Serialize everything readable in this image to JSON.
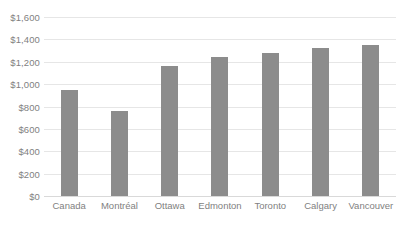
{
  "chart_data": {
    "type": "bar",
    "title": "",
    "xlabel": "",
    "ylabel": "",
    "categories": [
      "Canada",
      "Montréal",
      "Ottawa",
      "Edmonton",
      "Toronto",
      "Calgary",
      "Vancouver"
    ],
    "values": [
      947,
      760,
      1162,
      1243,
      1278,
      1323,
      1350
    ],
    "ylim": [
      0,
      1600
    ],
    "ytick_values": [
      0,
      200,
      400,
      600,
      800,
      1000,
      1200,
      1400,
      1600
    ],
    "ytick_labels": [
      "$0",
      "$200",
      "$400",
      "$600",
      "$800",
      "$1,000",
      "$1,200",
      "$1,400",
      "$1,600"
    ],
    "grid": true,
    "legend": false,
    "series": [
      {
        "name": "",
        "values": [
          947,
          760,
          1162,
          1243,
          1278,
          1323,
          1350
        ],
        "color": "#8c8c8c"
      }
    ]
  },
  "colors": {
    "bar": "#8c8c8c",
    "gridline": "#e6e6e6",
    "axis_text": "#7f7f7f",
    "background": "#ffffff"
  }
}
